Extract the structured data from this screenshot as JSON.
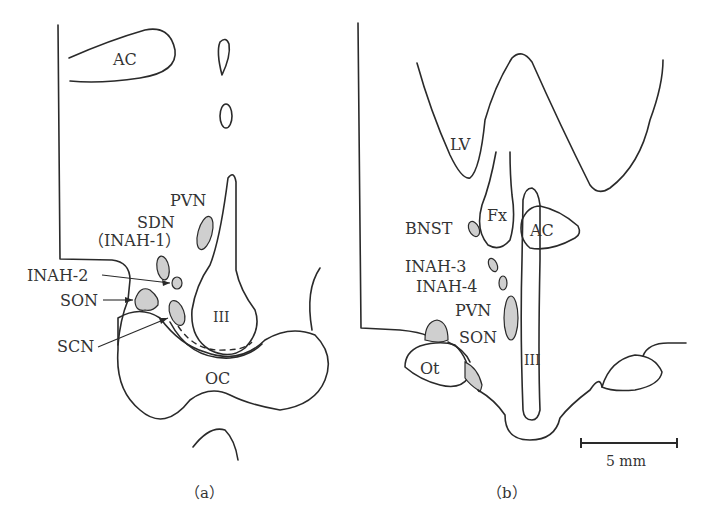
{
  "panels": [
    {
      "id": "a",
      "caption": "（a）",
      "labels": {
        "ac": "AC",
        "pvn": "PVN",
        "sdn": "SDN",
        "inah1": "（INAH-1）",
        "inah2": "INAH-2",
        "son": "SON",
        "scn": "SCN",
        "iii": "III",
        "oc": "OC"
      }
    },
    {
      "id": "b",
      "caption": "（b）",
      "labels": {
        "lv": "LV",
        "fx": "Fx",
        "ac": "AC",
        "bnst": "BNST",
        "inah3": "INAH-3",
        "inah4": "INAH-4",
        "pvn": "PVN",
        "son": "SON",
        "ot": "Ot",
        "iii": "III"
      }
    }
  ],
  "scale_bar": {
    "label": "5 mm"
  },
  "colors": {
    "nucleus_fill": "#cfcfcf",
    "stroke": "#2a2a2a",
    "background": "#ffffff"
  }
}
